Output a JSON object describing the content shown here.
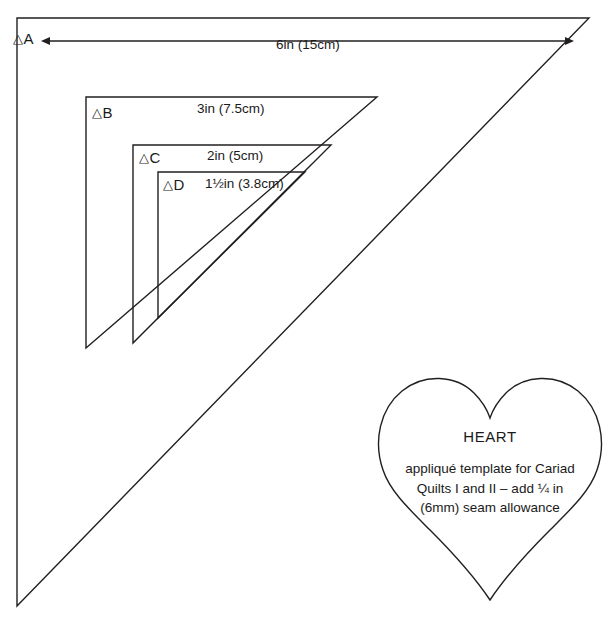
{
  "page": {
    "background_color": "#ffffff",
    "line_color": "#231f20",
    "text_color": "#1a1a1a"
  },
  "triangles": [
    {
      "id": "A",
      "tag_glyph": "△",
      "tag_letter": "A",
      "dimension_label": "6in (15cm)",
      "has_dimension_arrow": true,
      "points": "17,18 589,18 17,606"
    },
    {
      "id": "B",
      "tag_glyph": "△",
      "tag_letter": "B",
      "dimension_label": "3in (7.5cm)",
      "has_dimension_arrow": false,
      "points": "86,97 377,97 86,348"
    },
    {
      "id": "C",
      "tag_glyph": "△",
      "tag_letter": "C",
      "dimension_label": "2in (5cm)",
      "has_dimension_arrow": false,
      "points": "133,145 331,145 133,343"
    },
    {
      "id": "D",
      "tag_glyph": "△",
      "tag_letter": "D",
      "dimension_label": "1½in (3.8cm)",
      "has_dimension_arrow": false,
      "points": "158,172 305,172 158,318"
    }
  ],
  "heart": {
    "title": "HEART",
    "body_lines": [
      "appliqué template for Cariad",
      "Quilts I and II – add ¼ in",
      "(6mm) seam allowance"
    ]
  }
}
